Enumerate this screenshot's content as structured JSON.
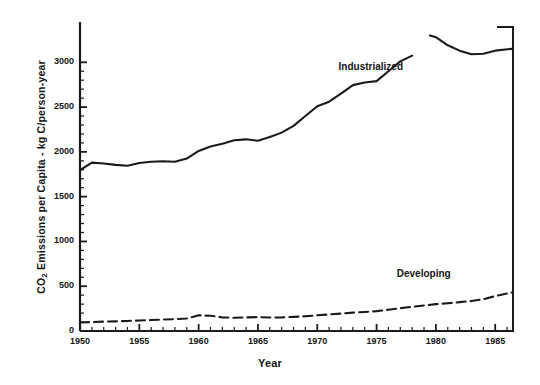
{
  "chart_data": {
    "type": "line",
    "title": "",
    "xlabel": "Year",
    "ylabel": "CO2 Emissions per Capita - kg C/person-year",
    "ylabel_parts": {
      "prefix": "CO",
      "sub": "2",
      "suffix": " Emissions per Capita - kg C/person-year"
    },
    "xlim": [
      1950,
      1986.5
    ],
    "ylim": [
      0,
      3450
    ],
    "grid": false,
    "legend_position": "inline-annotation",
    "y_ticks": [
      0,
      500,
      1000,
      1500,
      2000,
      2500,
      3000
    ],
    "y_tick_labels": [
      "0",
      "500",
      "1000",
      "1500",
      "2000",
      "2500",
      "3000"
    ],
    "y_minor_tick_step": 100,
    "x_ticks": [
      1950,
      1955,
      1960,
      1965,
      1970,
      1975,
      1980,
      1985
    ],
    "x_tick_labels": [
      "1950",
      "1955",
      "1960",
      "1965",
      "1970",
      "1975",
      "1980",
      "1985"
    ],
    "x_minor_tick_step": 1,
    "series": [
      {
        "name": "Industrialized",
        "style": "solid",
        "color": "#1a1a1a",
        "label_x": 1975.0,
        "label_y": 2950,
        "x": [
          1950,
          1951,
          1952,
          1953,
          1954,
          1955,
          1956,
          1957,
          1958,
          1959,
          1960,
          1961,
          1962,
          1963,
          1964,
          1965,
          1966,
          1967,
          1968,
          1969,
          1970,
          1971,
          1972,
          1973,
          1974,
          1975,
          1976,
          1977,
          1978
        ],
        "values": [
          1795,
          1880,
          1870,
          1855,
          1845,
          1875,
          1890,
          1895,
          1890,
          1925,
          2010,
          2060,
          2090,
          2130,
          2140,
          2125,
          2165,
          2215,
          2290,
          2400,
          2510,
          2560,
          2650,
          2745,
          2775,
          2790,
          2900,
          3010,
          3075
        ],
        "x2": [
          1979.5,
          1980,
          1981,
          1982,
          1983,
          1984,
          1985,
          1986.4
        ],
        "values2": [
          3300,
          3280,
          3190,
          3130,
          3090,
          3095,
          3130,
          3150
        ]
      },
      {
        "name": "Developing",
        "style": "dashed",
        "color": "#1a1a1a",
        "label_x": 1979.4,
        "label_y": 640,
        "x": [
          1950,
          1951,
          1952,
          1953,
          1954,
          1955,
          1956,
          1957,
          1958,
          1959,
          1960,
          1961,
          1962,
          1963,
          1964,
          1965,
          1966,
          1967,
          1968,
          1969,
          1970,
          1971,
          1972,
          1973,
          1974,
          1975,
          1976,
          1977,
          1978,
          1979,
          1980,
          1981,
          1982,
          1983,
          1984,
          1985,
          1986.4
        ],
        "values": [
          95,
          100,
          105,
          108,
          112,
          118,
          122,
          128,
          132,
          140,
          175,
          170,
          152,
          148,
          152,
          155,
          150,
          152,
          158,
          165,
          175,
          185,
          195,
          205,
          212,
          222,
          238,
          255,
          270,
          285,
          300,
          310,
          322,
          335,
          355,
          390,
          430
        ]
      }
    ]
  }
}
